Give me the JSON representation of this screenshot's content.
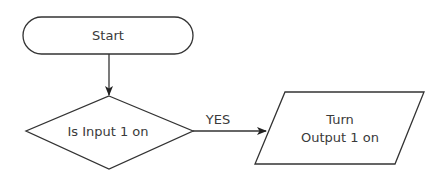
{
  "diagram": {
    "type": "flowchart",
    "nodes": [
      {
        "id": "start",
        "shape": "terminal",
        "label": "Start"
      },
      {
        "id": "decision",
        "shape": "diamond",
        "label": "Is Input 1 on"
      },
      {
        "id": "output",
        "shape": "parallelogram",
        "label_line1": "Turn",
        "label_line2": "Output 1 on"
      }
    ],
    "edges": [
      {
        "from": "start",
        "to": "decision",
        "label": ""
      },
      {
        "from": "decision",
        "to": "output",
        "label": "YES"
      }
    ]
  },
  "colors": {
    "stroke": "#333333",
    "fill": "#ffffff",
    "text": "#3a3a3a"
  }
}
